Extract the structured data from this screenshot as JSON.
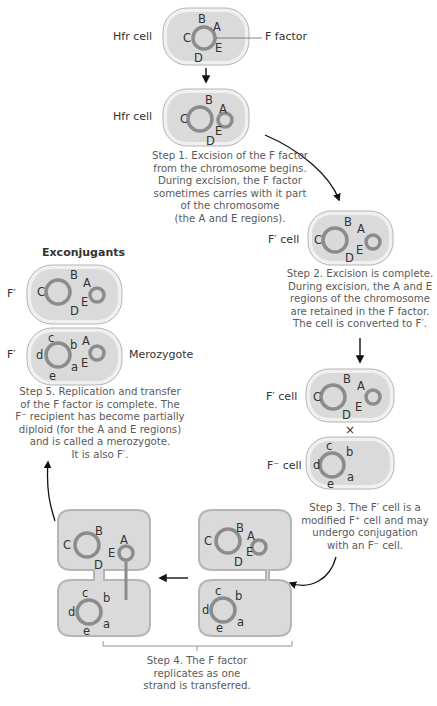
{
  "colors": {
    "cell_fill": "#dcdcdc",
    "cell_outer": "#f2f2f2",
    "cell_stroke": "#b0b0b0",
    "dna_ring": "#8a8a8a",
    "text": "#555555",
    "arrow": "#111111"
  },
  "cells": {
    "hfr_1": {
      "label": "Hfr cell",
      "callout": "F factor",
      "genes": [
        "B",
        "A",
        "C",
        "E",
        "D"
      ]
    },
    "hfr_2": {
      "label": "Hfr cell",
      "genes": [
        "B",
        "A",
        "C",
        "E",
        "D"
      ]
    },
    "fprime_step2": {
      "label": "F′ cell",
      "genes": [
        "B",
        "A",
        "C",
        "E",
        "D"
      ]
    },
    "fprime_step3": {
      "label": "F′ cell",
      "genes": [
        "B",
        "A",
        "C",
        "E",
        "D"
      ]
    },
    "fminus_step3": {
      "label": "F⁻ cell",
      "genes": [
        "c",
        "b",
        "d",
        "a",
        "e"
      ]
    },
    "exconj_1": {
      "label": "F′",
      "genes": [
        "B",
        "A",
        "C",
        "E",
        "D"
      ]
    },
    "exconj_2": {
      "label": "F′",
      "side_label": "Merozygote",
      "genes": [
        "c",
        "b",
        "A",
        "d",
        "E",
        "a",
        "e"
      ]
    },
    "pair_left": {
      "top_genes": [
        "B",
        "A",
        "C",
        "E",
        "D"
      ],
      "bottom_genes": [
        "c",
        "b",
        "d",
        "a",
        "e"
      ]
    },
    "pair_right": {
      "top_genes": [
        "B",
        "A",
        "C",
        "E",
        "D"
      ],
      "bottom_genes": [
        "c",
        "b",
        "d",
        "a",
        "e"
      ]
    }
  },
  "symbols": {
    "cross": "×"
  },
  "headings": {
    "exconjugants": "Exconjugants"
  },
  "captions": {
    "step1": [
      "Step 1. Excision of the F factor",
      "from the chromosome begins.",
      "During excision, the F factor",
      "sometimes carries with it part",
      "of the chromosome",
      "(the A and E regions)."
    ],
    "step2": [
      "Step 2. Excision is complete.",
      "During excision, the A and E",
      "regions of the chromosome",
      "are retained in the F factor.",
      "The cell is converted to F′."
    ],
    "step3": [
      "Step 3. The F′ cell is a",
      "modified F⁺ cell and may",
      "undergo conjugation",
      "with an F⁻ cell."
    ],
    "step4": [
      "Step 4. The F factor",
      "replicates as one",
      "strand is transferred."
    ],
    "step5": [
      "Step 5. Replication and transfer",
      "of the F factor is complete. The",
      "F⁻ recipient has become partially",
      "diploid (for the A and E regions)",
      "and is called a merozygote.",
      "It is also F′."
    ]
  }
}
